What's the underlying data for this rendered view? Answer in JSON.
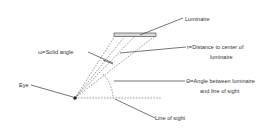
{
  "diagram": {
    "title": "",
    "labels": {
      "luminaire": "Luminaire",
      "solid_angle": "ω=Solid angle",
      "distance_line1": "r=Distance to center of",
      "distance_line2": "luminaire",
      "angle_line1": "Θ=Angle between luminaire",
      "angle_line2": "and line of sight",
      "eye": "Eye",
      "line_of_sight": "Line of sight"
    },
    "colors": {
      "line": "#3a3a3a",
      "luminaire_fill": "#d9d9d9",
      "text": "#333333"
    }
  }
}
